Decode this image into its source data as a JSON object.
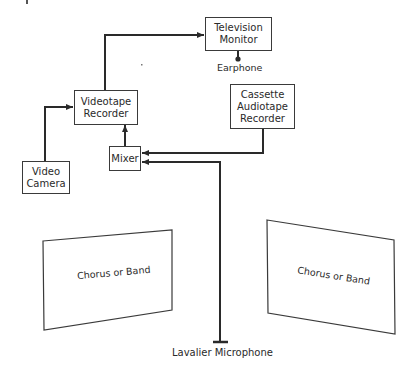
{
  "diagram": {
    "nodes": {
      "television_monitor": {
        "lines": [
          "Television",
          "Monitor"
        ]
      },
      "earphone": {
        "label": "Earphone"
      },
      "videotape_recorder": {
        "lines": [
          "Videotape",
          "Recorder"
        ]
      },
      "cassette_recorder": {
        "lines": [
          "Cassette",
          "Audiotape",
          "Recorder"
        ]
      },
      "mixer": {
        "label": "Mixer"
      },
      "video_camera": {
        "lines": [
          "Video",
          "Camera"
        ]
      },
      "chorus_left": {
        "label": "Chorus or Band"
      },
      "chorus_right": {
        "label": "Chorus or Band"
      },
      "lavalier_microphone": {
        "label": "Lavalier Microphone"
      }
    },
    "edges": [
      {
        "from": "Video Camera",
        "to": "Videotape Recorder"
      },
      {
        "from": "Videotape Recorder",
        "to": "Television Monitor"
      },
      {
        "from": "Television Monitor",
        "to": "Earphone"
      },
      {
        "from": "Mixer",
        "to": "Videotape Recorder"
      },
      {
        "from": "Cassette Audiotape Recorder",
        "to": "Mixer"
      },
      {
        "from": "Lavalier Microphone",
        "to": "Mixer"
      }
    ],
    "line_color": "#2a2a2a"
  }
}
